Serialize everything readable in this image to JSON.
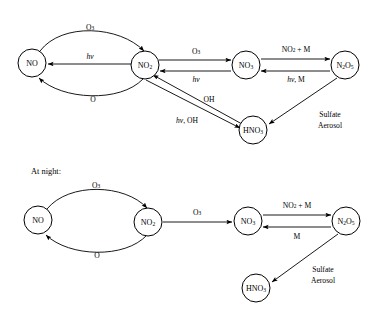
{
  "figure": {
    "background_color": "#ffffff",
    "stroke_color": "#000000",
    "sections": [
      {
        "id": "daytime",
        "label": ""
      },
      {
        "id": "nighttime",
        "label": "At night:"
      }
    ]
  },
  "daytime": {
    "nodes": [
      {
        "id": "no",
        "formula": "NO",
        "base": "NO",
        "sub": "",
        "cx": 32,
        "cy": 63,
        "r": 14
      },
      {
        "id": "no2",
        "formula": "NO2",
        "base": "NO",
        "sub": "2",
        "cx": 145,
        "cy": 65,
        "r": 14
      },
      {
        "id": "no3",
        "formula": "NO3",
        "base": "NO",
        "sub": "3",
        "cx": 246,
        "cy": 65,
        "r": 14
      },
      {
        "id": "n2o5",
        "formula": "N2O5",
        "base": "N",
        "sub": "2O5",
        "cx": 345,
        "cy": 65,
        "r": 14
      },
      {
        "id": "hno3",
        "formula": "HNO3",
        "base": "HNO",
        "sub": "3",
        "cx": 253,
        "cy": 130,
        "r": 14
      }
    ],
    "edges": [
      {
        "id": "no-to-no2-o3",
        "from": "no",
        "to": "no2",
        "label_base": "O",
        "label_sub": "3",
        "label_ital": "",
        "shape": "arc-top"
      },
      {
        "id": "no2-to-no-hv",
        "from": "no2",
        "to": "no",
        "label_base": "",
        "label_sub": "",
        "label_ital": "hv",
        "shape": "straight"
      },
      {
        "id": "no2-to-no-o",
        "from": "no2",
        "to": "no",
        "label_base": "O",
        "label_sub": "",
        "label_ital": "",
        "shape": "arc-bottom"
      },
      {
        "id": "no2-to-no3-o3",
        "from": "no2",
        "to": "no3",
        "label_base": "O",
        "label_sub": "3",
        "label_ital": "",
        "shape": "straight"
      },
      {
        "id": "no3-to-no2-hv",
        "from": "no3",
        "to": "no2",
        "label_base": "",
        "label_sub": "",
        "label_ital": "hv",
        "shape": "straight"
      },
      {
        "id": "no3-to-n2o5",
        "from": "no3",
        "to": "n2o5",
        "label_base": "NO",
        "label_sub": "2",
        "label_tail": " + M",
        "label_ital": "",
        "shape": "straight"
      },
      {
        "id": "n2o5-to-no3",
        "from": "n2o5",
        "to": "no3",
        "label_base": "",
        "label_sub": "",
        "label_ital": "hv",
        "label_tail": ", M",
        "shape": "straight"
      },
      {
        "id": "no2-to-hno3",
        "from": "no2",
        "to": "hno3",
        "label_base": "",
        "label_sub": "",
        "label_ital": "hv",
        "label_tail": ", OH",
        "shape": "diagonal"
      },
      {
        "id": "hno3-to-no2-oh",
        "from": "hno3",
        "to": "no2",
        "label_base": "OH",
        "label_sub": "",
        "label_ital": "",
        "shape": "diagonal"
      },
      {
        "id": "n2o5-to-hno3",
        "from": "n2o5",
        "to": "hno3",
        "label_base": "",
        "label_sub": "",
        "label_ital": "",
        "shape": "diagonal"
      }
    ],
    "edge_labels": {
      "o3_top": "O3",
      "hv_mid": "hv",
      "o_bottom": "O",
      "o3_right": "O3",
      "hv_no3": "hv",
      "no2_plus_m": "NO2 + M",
      "hv_m": "hv, M",
      "oh": "OH",
      "hv_oh": "hv, OH"
    },
    "annotations": [
      {
        "id": "sulfate-aerosol-day",
        "line1": "Sulfate",
        "line2": "Aerosol",
        "x": 330,
        "y": 120
      }
    ]
  },
  "nighttime": {
    "section_title": "At night:",
    "nodes": [
      {
        "id": "no-n",
        "formula": "NO",
        "base": "NO",
        "sub": "",
        "cx": 38,
        "cy": 220,
        "r": 14
      },
      {
        "id": "no2-n",
        "formula": "NO2",
        "base": "NO",
        "sub": "2",
        "cx": 148,
        "cy": 222,
        "r": 14
      },
      {
        "id": "no3-n",
        "formula": "NO3",
        "base": "NO",
        "sub": "3",
        "cx": 248,
        "cy": 221,
        "r": 14
      },
      {
        "id": "n2o5-n",
        "formula": "N2O5",
        "base": "N",
        "sub": "2O5",
        "cx": 346,
        "cy": 221,
        "r": 14
      },
      {
        "id": "hno3-n",
        "formula": "HNO3",
        "base": "HNO",
        "sub": "3",
        "cx": 256,
        "cy": 288,
        "r": 14
      }
    ],
    "edges": [
      {
        "id": "no-to-no2-o3-n",
        "from": "no-n",
        "to": "no2-n",
        "label_base": "O",
        "label_sub": "3",
        "shape": "arc-top"
      },
      {
        "id": "no2-to-no-o-n",
        "from": "no2-n",
        "to": "no-n",
        "label_base": "O",
        "label_sub": "",
        "shape": "arc-bottom"
      },
      {
        "id": "no2-to-no3-o3-n",
        "from": "no2-n",
        "to": "no3-n",
        "label_base": "O",
        "label_sub": "3",
        "shape": "straight"
      },
      {
        "id": "no3-to-n2o5-n",
        "from": "no3-n",
        "to": "n2o5-n",
        "label_base": "NO",
        "label_sub": "2",
        "label_tail": " + M",
        "shape": "straight"
      },
      {
        "id": "n2o5-to-no3-n",
        "from": "n2o5-n",
        "to": "no3-n",
        "label_base": "M",
        "label_sub": "",
        "shape": "straight"
      },
      {
        "id": "n2o5-to-hno3-n",
        "from": "n2o5-n",
        "to": "hno3-n",
        "label_base": "",
        "label_sub": "",
        "shape": "diagonal"
      }
    ],
    "edge_labels": {
      "o3_top": "O3",
      "o_bottom": "O",
      "o3_right": "O3",
      "no2_plus_m": "NO2 + M",
      "m": "M"
    },
    "annotations": [
      {
        "id": "sulfate-aerosol-night",
        "line1": "Sulfate",
        "line2": "Aerosol",
        "x": 323,
        "y": 275
      }
    ]
  }
}
